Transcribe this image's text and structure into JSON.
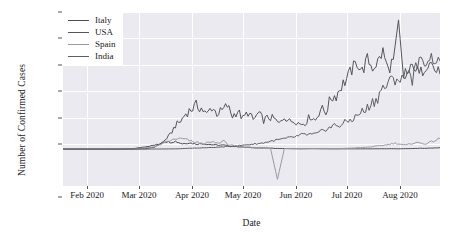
{
  "chart_data": {
    "type": "line",
    "title": "",
    "xlabel": "Date",
    "ylabel": "Number of Confirmed Cases",
    "grid": true,
    "legend_position": "upper left",
    "xlim": [
      "2020-01-22",
      "2020-08-27"
    ],
    "ylim": [
      -28000,
      104000
    ],
    "ytick_labels": [
      "100k",
      "80k",
      "60k",
      "40k",
      "20k",
      "0",
      "−20k"
    ],
    "ytick_values": [
      100000,
      80000,
      60000,
      40000,
      20000,
      0,
      -20000
    ],
    "xtick_labels": [
      "Feb 2020",
      "Mar 2020",
      "Apr 2020",
      "May 2020",
      "Jun 2020",
      "Jul 2020",
      "Aug 2020"
    ],
    "xtick_values": [
      "2020-02-01",
      "2020-03-01",
      "2020-04-01",
      "2020-05-01",
      "2020-06-01",
      "2020-07-01",
      "2020-08-01"
    ],
    "colors": {
      "Italy": "#4c4c54",
      "USA": "#55555d",
      "Spain": "#9a9aa2",
      "India": "#5e5e66"
    },
    "series": [
      {
        "name": "Italy",
        "color": "#4c4c54",
        "x": [
          "2020-01-22",
          "2020-02-01",
          "2020-02-11",
          "2020-02-21",
          "2020-02-26",
          "2020-03-02",
          "2020-03-07",
          "2020-03-12",
          "2020-03-17",
          "2020-03-21",
          "2020-03-24",
          "2020-03-27",
          "2020-03-31",
          "2020-04-04",
          "2020-04-08",
          "2020-04-12",
          "2020-04-16",
          "2020-04-20",
          "2020-04-24",
          "2020-04-28",
          "2020-05-02",
          "2020-05-06",
          "2020-05-10",
          "2020-05-14",
          "2020-05-18",
          "2020-05-22",
          "2020-05-26",
          "2020-05-30",
          "2020-06-03",
          "2020-06-08",
          "2020-06-12",
          "2020-06-16",
          "2020-06-20",
          "2020-06-24",
          "2020-06-28",
          "2020-07-02",
          "2020-07-06",
          "2020-07-10",
          "2020-07-14",
          "2020-07-18",
          "2020-07-22",
          "2020-07-26",
          "2020-07-30",
          "2020-08-03",
          "2020-08-07",
          "2020-08-11",
          "2020-08-15",
          "2020-08-19",
          "2020-08-23",
          "2020-08-27"
        ],
        "y": [
          0,
          0,
          0,
          0,
          60,
          250,
          1200,
          2300,
          3500,
          5900,
          5200,
          5900,
          4050,
          4800,
          3800,
          4100,
          3500,
          3000,
          3000,
          2100,
          1900,
          1400,
          1100,
          900,
          800,
          650,
          400,
          400,
          300,
          200,
          300,
          300,
          250,
          200,
          150,
          200,
          200,
          200,
          200,
          200,
          250,
          250,
          300,
          200,
          350,
          400,
          600,
          600,
          800,
          1000
        ]
      },
      {
        "name": "USA",
        "color": "#55555d",
        "x": [
          "2020-01-22",
          "2020-02-01",
          "2020-02-11",
          "2020-02-21",
          "2020-02-29",
          "2020-03-05",
          "2020-03-10",
          "2020-03-15",
          "2020-03-20",
          "2020-03-24",
          "2020-03-27",
          "2020-03-30",
          "2020-04-02",
          "2020-04-05",
          "2020-04-08",
          "2020-04-11",
          "2020-04-14",
          "2020-04-17",
          "2020-04-20",
          "2020-04-23",
          "2020-04-26",
          "2020-04-29",
          "2020-05-02",
          "2020-05-05",
          "2020-05-08",
          "2020-05-11",
          "2020-05-14",
          "2020-05-17",
          "2020-05-20",
          "2020-05-23",
          "2020-05-26",
          "2020-05-29",
          "2020-06-01",
          "2020-06-04",
          "2020-06-07",
          "2020-06-10",
          "2020-06-13",
          "2020-06-16",
          "2020-06-19",
          "2020-06-22",
          "2020-06-25",
          "2020-06-28",
          "2020-07-01",
          "2020-07-04",
          "2020-07-07",
          "2020-07-10",
          "2020-07-13",
          "2020-07-16",
          "2020-07-19",
          "2020-07-22",
          "2020-07-25",
          "2020-07-28",
          "2020-07-31",
          "2020-08-03",
          "2020-08-06",
          "2020-08-09",
          "2020-08-12",
          "2020-08-15",
          "2020-08-18",
          "2020-08-21",
          "2020-08-24",
          "2020-08-27"
        ],
        "y": [
          0,
          0,
          0,
          0,
          20,
          100,
          300,
          1500,
          5500,
          11000,
          18000,
          21000,
          27000,
          30000,
          33000,
          31000,
          26000,
          32000,
          27000,
          29000,
          33000,
          25000,
          29000,
          23000,
          28000,
          22000,
          27000,
          22000,
          24000,
          23000,
          19000,
          25000,
          21000,
          22000,
          19000,
          20000,
          25000,
          22000,
          31000,
          28000,
          39000,
          41000,
          48000,
          53000,
          60000,
          66000,
          59000,
          68000,
          62000,
          66000,
          74000,
          60000,
          68000,
          98000,
          53000,
          58000,
          64000,
          56000,
          62000,
          68000,
          60000,
          57000
        ]
      },
      {
        "name": "Spain",
        "color": "#9a9aa2",
        "x": [
          "2020-01-22",
          "2020-02-01",
          "2020-02-11",
          "2020-02-21",
          "2020-03-01",
          "2020-03-06",
          "2020-03-11",
          "2020-03-16",
          "2020-03-21",
          "2020-03-25",
          "2020-03-28",
          "2020-03-31",
          "2020-04-03",
          "2020-04-06",
          "2020-04-09",
          "2020-04-12",
          "2020-04-15",
          "2020-04-18",
          "2020-04-21",
          "2020-04-24",
          "2020-04-27",
          "2020-04-30",
          "2020-05-03",
          "2020-05-06",
          "2020-05-09",
          "2020-05-13",
          "2020-05-17",
          "2020-05-21",
          "2020-05-25",
          "2020-05-29",
          "2020-06-02",
          "2020-06-08",
          "2020-06-14",
          "2020-06-20",
          "2020-06-26",
          "2020-07-02",
          "2020-07-08",
          "2020-07-14",
          "2020-07-20",
          "2020-07-26",
          "2020-08-01",
          "2020-08-07",
          "2020-08-13",
          "2020-08-19",
          "2020-08-23",
          "2020-08-27"
        ],
        "y": [
          0,
          0,
          0,
          0,
          50,
          300,
          1200,
          2000,
          4900,
          6800,
          7900,
          7800,
          7000,
          5500,
          5000,
          4000,
          5000,
          5200,
          4200,
          6700,
          2800,
          3000,
          1200,
          1300,
          1500,
          700,
          600,
          500,
          -23000,
          400,
          300,
          300,
          400,
          300,
          350,
          500,
          800,
          1200,
          2000,
          3000,
          4500,
          3000,
          5000,
          4000,
          6000,
          8000
        ]
      },
      {
        "name": "India",
        "color": "#5e5e66",
        "x": [
          "2020-01-22",
          "2020-02-11",
          "2020-03-01",
          "2020-03-11",
          "2020-03-21",
          "2020-03-28",
          "2020-04-04",
          "2020-04-11",
          "2020-04-18",
          "2020-04-25",
          "2020-05-02",
          "2020-05-09",
          "2020-05-16",
          "2020-05-23",
          "2020-05-30",
          "2020-06-03",
          "2020-06-06",
          "2020-06-09",
          "2020-06-12",
          "2020-06-15",
          "2020-06-18",
          "2020-06-21",
          "2020-06-24",
          "2020-06-27",
          "2020-06-30",
          "2020-07-03",
          "2020-07-06",
          "2020-07-09",
          "2020-07-12",
          "2020-07-15",
          "2020-07-18",
          "2020-07-21",
          "2020-07-24",
          "2020-07-27",
          "2020-07-30",
          "2020-08-02",
          "2020-08-05",
          "2020-08-08",
          "2020-08-11",
          "2020-08-14",
          "2020-08-17",
          "2020-08-20",
          "2020-08-23",
          "2020-08-27"
        ],
        "y": [
          0,
          0,
          0,
          30,
          100,
          200,
          600,
          900,
          1200,
          1800,
          2500,
          3500,
          4500,
          6500,
          8000,
          9000,
          9900,
          11000,
          11000,
          11000,
          12000,
          15000,
          16000,
          18000,
          18000,
          20000,
          22000,
          24000,
          28000,
          29000,
          35000,
          37000,
          45000,
          48000,
          52000,
          54000,
          52000,
          62000,
          53000,
          66000,
          65000,
          69000,
          69000,
          67000
        ]
      }
    ],
    "annotations": [
      {
        "label": "negative-spike",
        "series": "Spain",
        "date": "2020-05-25",
        "value": -23000
      },
      {
        "label": "usa-max-spike",
        "series": "USA",
        "date": "2020-08-03",
        "value": 98000
      }
    ]
  },
  "legend": {
    "items": [
      {
        "label": "Italy"
      },
      {
        "label": "USA"
      },
      {
        "label": "Spain"
      },
      {
        "label": "India"
      }
    ]
  }
}
